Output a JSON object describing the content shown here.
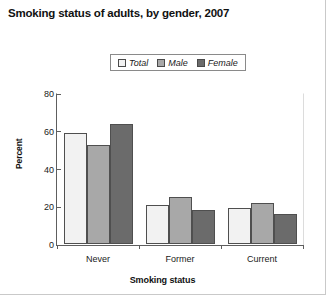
{
  "chart_data": {
    "type": "bar",
    "title": "Smoking status of adults, by gender, 2007",
    "xlabel": "Smoking status",
    "ylabel": "Percent",
    "categories": [
      "Never",
      "Former",
      "Current"
    ],
    "series": [
      {
        "name": "Total",
        "values": [
          59,
          21,
          19
        ],
        "color": "#f2f2f2"
      },
      {
        "name": "Male",
        "values": [
          53,
          25,
          22
        ],
        "color": "#a8a8a8"
      },
      {
        "name": "Female",
        "values": [
          64,
          18,
          16
        ],
        "color": "#6b6b6b"
      }
    ],
    "ylim": [
      0,
      80
    ],
    "yticks": [
      0,
      20,
      40,
      60,
      80
    ],
    "grid": false,
    "legend_position": "top-center"
  },
  "colors": {
    "total": "#f2f2f2",
    "male": "#a8a8a8",
    "female": "#6b6b6b",
    "axis": "#5e5e5e",
    "bar_outline": "#4f4f4f",
    "text": "#1a1a1a"
  }
}
